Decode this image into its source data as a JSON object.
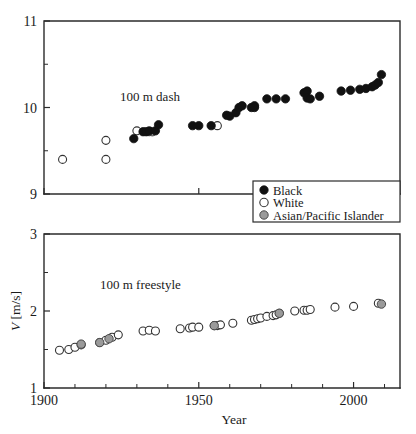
{
  "figure": {
    "title": "",
    "panels": [
      "100 m dash",
      "100 m freestyle"
    ]
  },
  "legend": {
    "position": "center-right",
    "entries": [
      {
        "label": "Black",
        "marker": "filled-circle",
        "color": "#111111"
      },
      {
        "label": "White",
        "marker": "open-circle",
        "color": "#ffffff"
      },
      {
        "label": "Asian/Pacific Islander",
        "marker": "gray-circle",
        "color": "#9a9a9a"
      }
    ]
  },
  "chart_data": [
    {
      "type": "scatter",
      "title": "100 m dash",
      "xlabel": "",
      "ylabel": "",
      "xlim": [
        1900,
        2015
      ],
      "ylim": [
        9,
        11
      ],
      "xticks": [
        1900,
        1950,
        2000
      ],
      "xticklabels": [
        "1900",
        "1950",
        "2000"
      ],
      "yticks": [
        9,
        10,
        11
      ],
      "yticklabels": [
        "9",
        "10",
        "11"
      ],
      "yminorticks": [
        9.5,
        10.5
      ],
      "grid": false,
      "series": [
        {
          "name": "White",
          "marker": "open-circle",
          "points": [
            [
              1906,
              9.4
            ],
            [
              1920,
              9.4
            ],
            [
              1920,
              9.62
            ],
            [
              1930,
              9.73
            ],
            [
              1934,
              9.72
            ],
            [
              1956,
              9.79
            ]
          ]
        },
        {
          "name": "Black",
          "marker": "filled-circle",
          "points": [
            [
              1929,
              9.64
            ],
            [
              1932,
              9.72
            ],
            [
              1933,
              9.72
            ],
            [
              1934,
              9.73
            ],
            [
              1936,
              9.73
            ],
            [
              1937,
              9.8
            ],
            [
              1948,
              9.79
            ],
            [
              1950,
              9.79
            ],
            [
              1954,
              9.79
            ],
            [
              1959,
              9.91
            ],
            [
              1960,
              9.9
            ],
            [
              1962,
              9.94
            ],
            [
              1963,
              10.0
            ],
            [
              1964,
              10.02
            ],
            [
              1967,
              10.0
            ],
            [
              1968,
              10.02
            ],
            [
              1968,
              10.0
            ],
            [
              1972,
              10.1
            ],
            [
              1975,
              10.1
            ],
            [
              1978,
              10.1
            ],
            [
              1984,
              10.17
            ],
            [
              1985,
              10.19
            ],
            [
              1985,
              10.11
            ],
            [
              1986,
              10.1
            ],
            [
              1989,
              10.13
            ],
            [
              1996,
              10.19
            ],
            [
              1999,
              10.2
            ],
            [
              2002,
              10.21
            ],
            [
              2004,
              10.22
            ],
            [
              2006,
              10.24
            ],
            [
              2007,
              10.26
            ],
            [
              2008,
              10.29
            ],
            [
              2009,
              10.38
            ]
          ]
        },
        {
          "name": "Asian/Pacific Islander",
          "marker": "gray-circle",
          "points": [
            [
              1935,
              9.72
            ]
          ]
        }
      ]
    },
    {
      "type": "scatter",
      "title": "100 m freestyle",
      "xlabel": "Year",
      "ylabel": "V [m/s]",
      "xlim": [
        1900,
        2015
      ],
      "ylim": [
        1,
        3
      ],
      "xticks": [
        1900,
        1950,
        2000
      ],
      "xticklabels": [
        "1900",
        "1950",
        "2000"
      ],
      "xminorticks": [
        1910,
        1920,
        1930,
        1940,
        1960,
        1970,
        1980,
        1990,
        2010
      ],
      "yticks": [
        1,
        2,
        3
      ],
      "yticklabels": [
        "1",
        "2",
        "3"
      ],
      "yminorticks": [
        1.5,
        2.5
      ],
      "grid": false,
      "series": [
        {
          "name": "White",
          "marker": "open-circle",
          "points": [
            [
              1905,
              1.49
            ],
            [
              1908,
              1.5
            ],
            [
              1910,
              1.53
            ],
            [
              1912,
              1.56
            ],
            [
              1918,
              1.59
            ],
            [
              1920,
              1.62
            ],
            [
              1922,
              1.66
            ],
            [
              1924,
              1.69
            ],
            [
              1932,
              1.74
            ],
            [
              1934,
              1.75
            ],
            [
              1936,
              1.74
            ],
            [
              1944,
              1.77
            ],
            [
              1947,
              1.78
            ],
            [
              1948,
              1.79
            ],
            [
              1950,
              1.79
            ],
            [
              1955,
              1.81
            ],
            [
              1956,
              1.81
            ],
            [
              1957,
              1.82
            ],
            [
              1961,
              1.84
            ],
            [
              1967,
              1.88
            ],
            [
              1968,
              1.89
            ],
            [
              1969,
              1.9
            ],
            [
              1970,
              1.91
            ],
            [
              1972,
              1.93
            ],
            [
              1974,
              1.94
            ],
            [
              1975,
              1.95
            ],
            [
              1976,
              1.97
            ],
            [
              1981,
              2.0
            ],
            [
              1984,
              2.01
            ],
            [
              1985,
              2.01
            ],
            [
              1986,
              2.02
            ],
            [
              1994,
              2.05
            ],
            [
              2000,
              2.06
            ],
            [
              2008,
              2.1
            ]
          ]
        },
        {
          "name": "Asian/Pacific Islander",
          "marker": "gray-circle",
          "points": [
            [
              1912,
              1.57
            ],
            [
              1918,
              1.59
            ],
            [
              1921,
              1.64
            ],
            [
              1955,
              1.81
            ],
            [
              1976,
              1.97
            ],
            [
              2009,
              2.09
            ]
          ]
        }
      ]
    }
  ]
}
